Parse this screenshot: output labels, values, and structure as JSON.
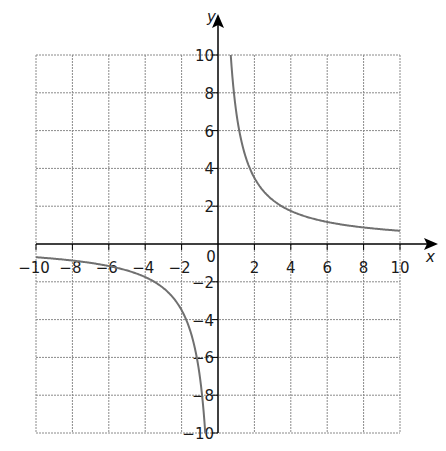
{
  "chart_data": {
    "type": "line",
    "title": "",
    "xlabel": "x",
    "ylabel": "y",
    "xlim": [
      -10,
      10
    ],
    "ylim": [
      -10,
      10
    ],
    "grid": true,
    "x_ticks": [
      -10,
      -8,
      -6,
      -4,
      -2,
      0,
      2,
      4,
      6,
      8,
      10
    ],
    "y_ticks": [
      -10,
      -8,
      -6,
      -4,
      -2,
      2,
      4,
      6,
      8,
      10
    ],
    "x_tick_labels": [
      "−10",
      "−8",
      "−6",
      "−4",
      "−2",
      "0",
      "2",
      "4",
      "6",
      "8",
      "10"
    ],
    "y_tick_labels": [
      "−10",
      "−8",
      "−6",
      "−4",
      "−2",
      "2",
      "4",
      "6",
      "8",
      "10"
    ],
    "series": [
      {
        "name": "y = 7/x (positive branch)",
        "x": [
          0.7,
          1,
          1.5,
          2,
          3,
          4,
          5,
          6,
          7,
          8,
          9,
          10
        ],
        "y": [
          10,
          7,
          4.67,
          3.5,
          2.33,
          1.75,
          1.4,
          1.17,
          1.0,
          0.875,
          0.78,
          0.7
        ]
      },
      {
        "name": "y = 7/x (negative branch)",
        "x": [
          -10,
          -9,
          -8,
          -7,
          -6,
          -5,
          -4,
          -3,
          -2,
          -1.5,
          -1,
          -0.7
        ],
        "y": [
          -0.7,
          -0.78,
          -0.875,
          -1.0,
          -1.17,
          -1.4,
          -1.75,
          -2.33,
          -3.5,
          -4.67,
          -7,
          -10
        ]
      }
    ],
    "colors": {
      "curve": "#707070",
      "grid": "#8a8a8a",
      "axes": "#000000"
    }
  }
}
